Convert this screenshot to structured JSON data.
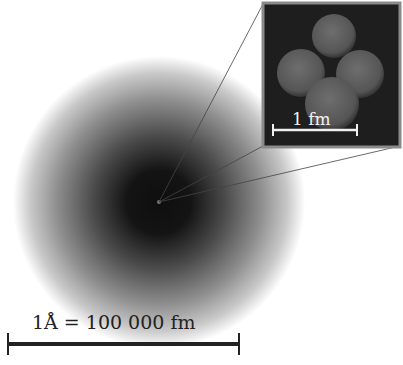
{
  "figure": {
    "atom": {
      "center": [
        159,
        202
      ],
      "radius": 146,
      "description": "electron cloud, dark center fading to white"
    },
    "nucleus_marker": {
      "position": [
        159,
        202
      ]
    },
    "inset": {
      "box": [
        263,
        3,
        137,
        144
      ],
      "border_color": "#8a8a8a",
      "background": "#1e1e1e",
      "nucleons": [
        {
          "cx": 334,
          "cy": 36,
          "r": 22
        },
        {
          "cx": 301,
          "cy": 73,
          "r": 24
        },
        {
          "cx": 360,
          "cy": 74,
          "r": 24
        },
        {
          "cx": 332,
          "cy": 104,
          "r": 27
        }
      ],
      "scale_bar": {
        "label": "1 fm",
        "x1": 273,
        "x2": 357,
        "y": 130
      }
    },
    "atom_scale_bar": {
      "label": "1Å = 100 000 fm",
      "x1": 8,
      "x2": 239,
      "y": 344
    },
    "colors": {
      "core": "#111111",
      "bar": "#222222",
      "inset_bar": "#f0f0f0",
      "leader_line": "#555555"
    }
  }
}
